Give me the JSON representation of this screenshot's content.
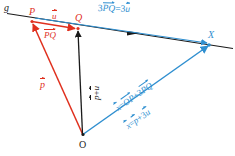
{
  "figure": {
    "type": "vector-geometry-diagram",
    "width": 235,
    "height": 156,
    "colors": {
      "line": "#1a1a1a",
      "red": "#e0301e",
      "blue": "#2f8fd0",
      "background": "#ffffff"
    }
  },
  "points": [
    {
      "id": "g",
      "label": "g",
      "color": "#1a1a1a",
      "x": 8,
      "y": 14,
      "kind": "line-name"
    },
    {
      "id": "P",
      "label": "P",
      "color": "#e0301e",
      "x": 32,
      "y": 21,
      "kind": "point"
    },
    {
      "id": "Q",
      "label": "Q",
      "color": "#e0301e",
      "x": 78,
      "y": 29,
      "kind": "point"
    },
    {
      "id": "X",
      "label": "X",
      "color": "#2f8fd0",
      "x": 210,
      "y": 44,
      "kind": "point"
    },
    {
      "id": "O",
      "label": "O",
      "color": "#1a1a1a",
      "x": 83,
      "y": 137,
      "kind": "point"
    }
  ],
  "labels": {
    "line_g": "g",
    "point_p": "P",
    "point_q": "Q",
    "point_x": "X",
    "point_o": "O",
    "u_vector": "u",
    "pq_vector": "PQ",
    "p_vector": "p",
    "p_plus_u": {
      "first": "p",
      "op": "+",
      "second": "u"
    },
    "three_pq_equals_three_u": {
      "coef1": "3",
      "term1": "PQ",
      "eq": "=",
      "coef2": "3",
      "term2": "u"
    },
    "x_equals_op_plus_3pq": {
      "lhs": "x",
      "eq": "=",
      "term1": "OP",
      "op": "+",
      "coef": "3",
      "term2": "PQ"
    },
    "x_equals_p_plus_3u": {
      "lhs": "x",
      "eq": "=",
      "term1": "p",
      "op": "+",
      "coef": "3",
      "term2": "u"
    }
  },
  "vectors": [
    {
      "name": "p-vector",
      "from": "O",
      "to": "P",
      "color": "#e0301e",
      "label": "p"
    },
    {
      "name": "pq-vector",
      "from": "P",
      "to": "Q",
      "color": "#e0301e",
      "label": "PQ"
    },
    {
      "name": "p-plus-u-vector",
      "from": "O",
      "to": "Q",
      "color": "#1a1a1a",
      "label": "p + u"
    },
    {
      "name": "x-vector",
      "from": "O",
      "to": "X",
      "color": "#2f8fd0",
      "label": "x"
    },
    {
      "name": "three-u-vector",
      "from": "P",
      "to": "X",
      "color": "#2f8fd0",
      "label": "3u"
    },
    {
      "name": "line-g",
      "from": "g-start",
      "to": "g-end",
      "color": "#1a1a1a",
      "label": "g"
    }
  ]
}
